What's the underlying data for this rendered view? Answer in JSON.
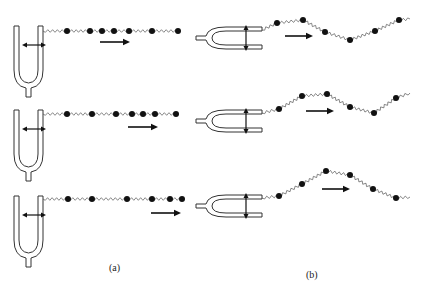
{
  "figure": {
    "panels": [
      {
        "label": "(a)",
        "description": "longitudinal wave from tuning fork",
        "rows": [
          {
            "fork_y": 26,
            "line_y": 31,
            "arrow": {
              "x1": 100,
              "x2": 130,
              "y": 42
            },
            "beads": [
              [
                67,
                31
              ],
              [
                90,
                31
              ],
              [
                102,
                31
              ],
              [
                114,
                31
              ],
              [
                129,
                31
              ],
              [
                152,
                31
              ],
              [
                178,
                31
              ]
            ]
          },
          {
            "fork_y": 110,
            "line_y": 114,
            "arrow": {
              "x1": 128,
              "x2": 158,
              "y": 127
            },
            "beads": [
              [
                67,
                114
              ],
              [
                92,
                114
              ],
              [
                116,
                114
              ],
              [
                132,
                114
              ],
              [
                143,
                114
              ],
              [
                155,
                114
              ],
              [
                176,
                114
              ]
            ]
          },
          {
            "fork_y": 196,
            "line_y": 199,
            "arrow": {
              "x1": 151,
              "x2": 181,
              "y": 213
            },
            "beads": [
              [
                68,
                199
              ],
              [
                92,
                199
              ],
              [
                127,
                199
              ],
              [
                152,
                199
              ],
              [
                170,
                199
              ],
              [
                182,
                199
              ]
            ]
          }
        ]
      },
      {
        "label": "(b)",
        "description": "transverse wave from tuning fork",
        "rows": [
          {
            "fork_y": 30,
            "arrow": {
              "x1": 285,
              "x2": 313,
              "y": 36
            },
            "beads": [
              [
                277,
                23
              ],
              [
                303,
                20
              ],
              [
                325,
                32
              ],
              [
                350,
                40
              ],
              [
                375,
                31
              ],
              [
                399,
                20
              ]
            ],
            "end": [
              410,
              19
            ],
            "start": [
              262,
              30
            ]
          },
          {
            "fork_y": 113,
            "arrow": {
              "x1": 306,
              "x2": 334,
              "y": 111
            },
            "beads": [
              [
                279,
                109
              ],
              [
                302,
                96
              ],
              [
                327,
                94
              ],
              [
                350,
                107
              ],
              [
                374,
                113
              ],
              [
                396,
                98
              ]
            ],
            "end": [
              410,
              93
            ],
            "start": [
              262,
              113
            ]
          },
          {
            "fork_y": 198,
            "arrow": {
              "x1": 322,
              "x2": 350,
              "y": 189
            },
            "beads": [
              [
                279,
                196
              ],
              [
                302,
                184
              ],
              [
                326,
                171
              ],
              [
                350,
                175
              ],
              [
                373,
                189
              ],
              [
                396,
                198
              ]
            ],
            "end": [
              410,
              197
            ],
            "start": [
              262,
              198
            ]
          }
        ]
      }
    ]
  }
}
